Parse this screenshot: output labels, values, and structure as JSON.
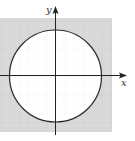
{
  "diagram": {
    "type": "graph-region",
    "axes": {
      "x_label": "x",
      "y_label": "y"
    },
    "circle": {
      "center": [
        0,
        0
      ],
      "stroke_color": "#2a2a2a"
    },
    "colors": {
      "shaded_region": "#d9d9d9",
      "interior": "#ffffff",
      "grid_line": "#c4c4c4",
      "interior_grid_line": "#ececec",
      "axis": "#222222"
    }
  }
}
